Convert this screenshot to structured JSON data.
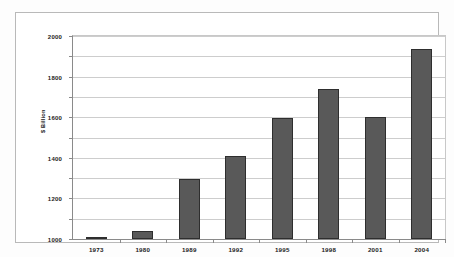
{
  "chart_data": {
    "type": "bar",
    "title": "",
    "subtitle": "",
    "xlabel": "",
    "ylabel": "$ Billion",
    "categories": [
      "1973",
      "1980",
      "1989",
      "1992",
      "1995",
      "1998",
      "2001",
      "2004"
    ],
    "values": [
      15,
      80,
      590,
      820,
      1190,
      1480,
      1200,
      1875
    ],
    "series": [
      {
        "name": "$ Billion",
        "values": [
          15,
          80,
          590,
          820,
          1190,
          1480,
          1200,
          1875
        ]
      }
    ],
    "ylim": [
      0,
      2000
    ],
    "y_ticks": [
      "0",
      "200",
      "400",
      "600",
      "800",
      "1000",
      "1200",
      "1400",
      "1600",
      "1800",
      "2000"
    ],
    "y_tick_values": [
      0,
      200,
      400,
      600,
      800,
      1000,
      1200,
      1400,
      1600,
      1800,
      2000
    ],
    "grid": true,
    "grid_axis": "y",
    "legend": false,
    "legend_position": "none",
    "bar_color": "#595959",
    "bar_border_color": "#2e2e2e",
    "grid_color": "#cdcdcd",
    "axis_color": "#8a8a8a",
    "plot_background": "#ffffff",
    "frame_color": "#b9b9b9"
  }
}
